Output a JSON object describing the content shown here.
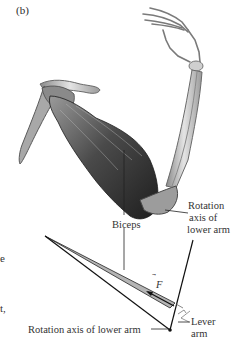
{
  "figure": {
    "panel_label": "(b)",
    "labels": {
      "biceps": "Biceps",
      "rotation_axis_upper": [
        "Rotation",
        "axis of",
        "lower arm"
      ],
      "force_vector": "F",
      "lever_arm": [
        "Lever",
        "arm"
      ],
      "rotation_axis_lower": "Rotation axis of lower arm"
    },
    "cropped_text_fragments": [
      "e",
      "t,"
    ],
    "colors": {
      "muscle_dark": "#3a3a3a",
      "muscle_mid": "#7a7a7a",
      "bone": "#d8d8d8",
      "bone_shade": "#9a9a9a",
      "diagram_fill": "#b0b0b0",
      "line": "#1a1a1a"
    }
  }
}
